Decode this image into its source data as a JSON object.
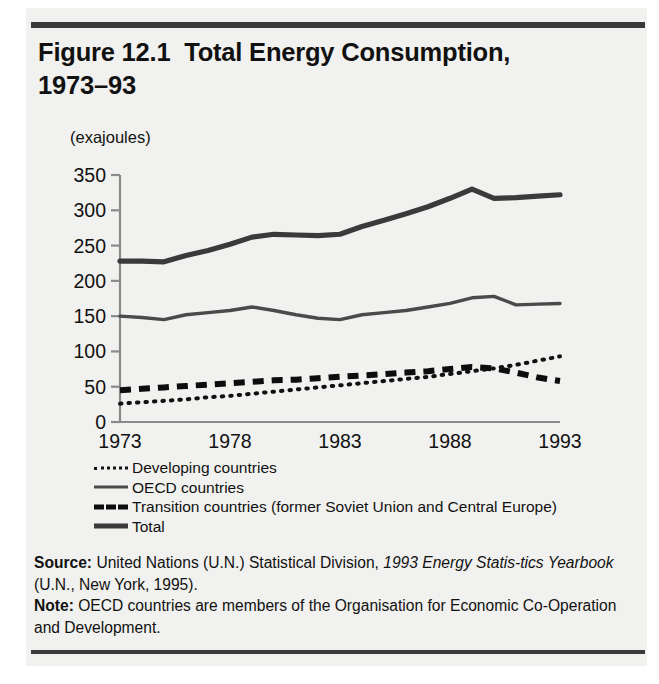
{
  "figure": {
    "title_line1": "Figure 12.1  Total Energy Consumption,",
    "title_line2": "1973–93",
    "units_label": "(exajoules)"
  },
  "legend": {
    "items": [
      {
        "label": "Developing countries",
        "key": "dotted",
        "color": "#111111"
      },
      {
        "label": "OECD countries",
        "key": "thin-solid",
        "color": "#4a4a4a"
      },
      {
        "label": "Transition countries (former Soviet Union and Central Europe)",
        "key": "bold-dashed",
        "color": "#0d0d0d"
      },
      {
        "label": "Total",
        "key": "thick-solid",
        "color": "#3a3a3a"
      }
    ]
  },
  "notes": {
    "source_lead": "Source:",
    "source_text_a": " United Nations (U.N.) Statistical Division, ",
    "source_italic": "1993 Energy Statis-tics Yearbook",
    "source_text_b": " (U.N., New York, 1995).",
    "note_lead": "Note:",
    "note_text": " OECD countries are members of the Organisation for Economic Co-Operation and Development."
  },
  "chart_data": {
    "type": "line",
    "title": "Figure 12.1  Total Energy Consumption, 1973–93",
    "xlabel": "",
    "ylabel": "(exajoules)",
    "xlim": [
      1973,
      1993
    ],
    "ylim": [
      0,
      350
    ],
    "yticks": [
      0,
      50,
      100,
      150,
      200,
      250,
      300,
      350
    ],
    "xticks": [
      1973,
      1978,
      1983,
      1988,
      1993
    ],
    "grid": false,
    "legend_position": "below-plot-left",
    "x": [
      1973,
      1974,
      1975,
      1976,
      1977,
      1978,
      1979,
      1980,
      1981,
      1982,
      1983,
      1984,
      1985,
      1986,
      1987,
      1988,
      1989,
      1990,
      1991,
      1992,
      1993
    ],
    "series": [
      {
        "name": "Total",
        "style": "thick-solid",
        "color": "#3a3a3a",
        "values": [
          228,
          228,
          227,
          236,
          243,
          252,
          262,
          266,
          265,
          264,
          266,
          277,
          286,
          295,
          305,
          317,
          330,
          317,
          318,
          320,
          322
        ]
      },
      {
        "name": "OECD countries",
        "style": "thin-solid",
        "color": "#4a4a4a",
        "values": [
          150,
          148,
          145,
          152,
          155,
          158,
          163,
          158,
          152,
          147,
          145,
          152,
          155,
          158,
          163,
          168,
          176,
          178,
          166,
          167,
          168
        ]
      },
      {
        "name": "Transition countries (former Soviet Union and Central Europe)",
        "style": "bold-dashed",
        "color": "#0d0d0d",
        "values": [
          45,
          47,
          49,
          51,
          53,
          55,
          57,
          59,
          60,
          62,
          64,
          66,
          68,
          70,
          72,
          75,
          78,
          76,
          70,
          63,
          58
        ]
      },
      {
        "name": "Developing countries",
        "style": "dotted",
        "color": "#111111",
        "values": [
          26,
          28,
          30,
          32,
          35,
          37,
          40,
          43,
          46,
          49,
          52,
          55,
          58,
          61,
          64,
          68,
          72,
          76,
          81,
          87,
          93
        ]
      }
    ]
  }
}
